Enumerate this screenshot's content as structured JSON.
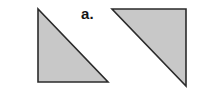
{
  "figure": {
    "label": "a.",
    "background_color": "#ffffff",
    "canvas": {
      "width": 197,
      "height": 89
    },
    "style": {
      "fill_color": "#c8c8c8",
      "stroke_color": "#2b2b2b",
      "stroke_width": 1.6,
      "label_color": "#141414"
    },
    "shapes": [
      {
        "name": "left-triangle",
        "type": "right-triangle",
        "orientation": "right-angle-bottom-left",
        "points": "38,9 38,82 108,82",
        "vertices": [
          {
            "x": 38,
            "y": 9
          },
          {
            "x": 38,
            "y": 82
          },
          {
            "x": 108,
            "y": 82
          }
        ],
        "legs": {
          "vertical": 73,
          "horizontal": 70
        }
      },
      {
        "name": "right-triangle",
        "type": "right-triangle",
        "orientation": "right-angle-top-right",
        "points": "112,9 186,9 186,86",
        "vertices": [
          {
            "x": 112,
            "y": 9
          },
          {
            "x": 186,
            "y": 9
          },
          {
            "x": 186,
            "y": 86
          }
        ],
        "legs": {
          "vertical": 77,
          "horizontal": 74
        }
      }
    ]
  }
}
